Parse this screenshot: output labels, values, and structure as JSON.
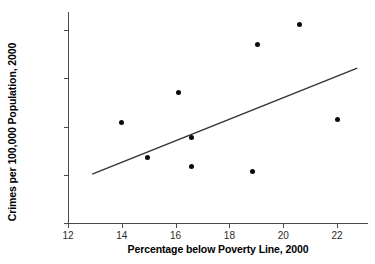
{
  "chart_data": {
    "type": "scatter",
    "title": "",
    "xlabel": "Percentage below Poverty Line, 2000",
    "ylabel": "Crimes per 100,000 Population, 2000",
    "xlim": [
      12,
      23.15
    ],
    "ylim": [
      3000,
      11750
    ],
    "grid": false,
    "legend": null,
    "xticks": [
      12,
      14,
      16,
      18,
      20,
      22
    ],
    "xtick_labels": [
      "12",
      "14",
      "16",
      "18",
      "20",
      "22"
    ],
    "yticks": [
      3000,
      5000,
      7000,
      9000,
      11000
    ],
    "ytick_labels": [
      "3,000",
      "5,000",
      "7,000",
      "9,000",
      "11,000"
    ],
    "points": [
      {
        "x": 14.0,
        "y": 7150
      },
      {
        "x": 14.95,
        "y": 5700
      },
      {
        "x": 16.1,
        "y": 8400
      },
      {
        "x": 16.6,
        "y": 6550
      },
      {
        "x": 16.6,
        "y": 5350
      },
      {
        "x": 18.85,
        "y": 5150
      },
      {
        "x": 19.05,
        "y": 10400
      },
      {
        "x": 20.6,
        "y": 11250
      },
      {
        "x": 22.0,
        "y": 7300
      }
    ],
    "trend_line": {
      "type": "line",
      "x": [
        12.9,
        22.75
      ],
      "y": [
        5030,
        9420
      ]
    },
    "marker_color": "#0a0a0a",
    "line_color": "#333333",
    "axis_color": "#4a4a4a",
    "background": "#ffffff"
  }
}
